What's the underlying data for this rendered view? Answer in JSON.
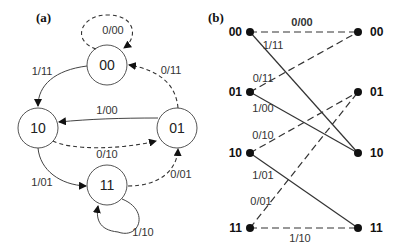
{
  "panel_a": {
    "label": "(a)",
    "states": [
      {
        "id": "00",
        "label": "00"
      },
      {
        "id": "10",
        "label": "10"
      },
      {
        "id": "01",
        "label": "01"
      },
      {
        "id": "11",
        "label": "11"
      }
    ],
    "transitions": [
      {
        "from": "00",
        "to": "00",
        "label": "0/00",
        "style": "dashed"
      },
      {
        "from": "00",
        "to": "10",
        "label": "1/11",
        "style": "solid"
      },
      {
        "from": "01",
        "to": "00",
        "label": "0/11",
        "style": "dashed"
      },
      {
        "from": "01",
        "to": "10",
        "label": "1/00",
        "style": "solid"
      },
      {
        "from": "10",
        "to": "01",
        "label": "0/10",
        "style": "dashed"
      },
      {
        "from": "10",
        "to": "11",
        "label": "1/01",
        "style": "solid"
      },
      {
        "from": "11",
        "to": "01",
        "label": "0/01",
        "style": "dashed"
      },
      {
        "from": "11",
        "to": "11",
        "label": "1/10",
        "style": "solid"
      }
    ]
  },
  "panel_b": {
    "label": "(b)",
    "left_nodes": [
      "00",
      "01",
      "10",
      "11"
    ],
    "right_nodes": [
      "00",
      "01",
      "10",
      "11"
    ],
    "branches": [
      {
        "from": "00",
        "to": "00",
        "label": "0/00",
        "style": "dashed"
      },
      {
        "from": "00",
        "to": "10",
        "label": "1/11",
        "style": "solid"
      },
      {
        "from": "01",
        "to": "00",
        "label": "0/11",
        "style": "dashed"
      },
      {
        "from": "01",
        "to": "10",
        "label": "1/00",
        "style": "solid"
      },
      {
        "from": "10",
        "to": "01",
        "label": "0/10",
        "style": "dashed"
      },
      {
        "from": "10",
        "to": "11",
        "label": "1/01",
        "style": "solid"
      },
      {
        "from": "11",
        "to": "01",
        "label": "0/01",
        "style": "dashed"
      },
      {
        "from": "11",
        "to": "11",
        "label": "1/10",
        "style": "dashed"
      }
    ]
  }
}
